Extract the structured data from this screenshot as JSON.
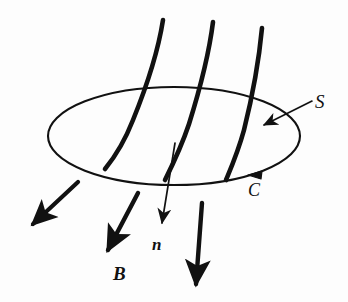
{
  "figure": {
    "background_color": "#fdfdfd",
    "ink_color": "#111111",
    "width": 348,
    "height": 302
  },
  "labels": {
    "surface": {
      "text": "S",
      "meaning": "open surface",
      "style": "italic-serif"
    },
    "boundary": {
      "text": "C",
      "meaning": "boundary curve of surface S",
      "style": "italic-serif"
    },
    "normal": {
      "text": "n",
      "meaning": "unit normal vector to surface",
      "style": "bold-italic-serif"
    },
    "field": {
      "text": "B",
      "meaning": "magnetic field vector",
      "style": "bold-italic-serif"
    }
  },
  "geometry": {
    "ellipse": {
      "center_x": 174,
      "center_y": 136,
      "radius_x": 126,
      "radius_y": 49,
      "stroke_width": 2.1
    },
    "field_lines": [
      {
        "name": "field-line-left",
        "path": "M163,20 C158,52 146,88 133,120 C124,143 114,158 105,169",
        "stroke_width": 4.6
      },
      {
        "name": "field-line-middle",
        "path": "M213,22 C209,54 199,92 189,124 C181,148 172,166 165,180",
        "stroke_width": 4.6
      },
      {
        "name": "field-line-right",
        "path": "M262,28 C259,60 252,98 244,130 C238,152 231,168 226,180",
        "stroke_width": 4.6
      }
    ],
    "field_arrows": [
      {
        "name": "field-arrow-outer-left",
        "path": "M78,182 L30,227",
        "stroke_width": 4.2,
        "head_size": 11
      },
      {
        "name": "field-arrow-B",
        "path": "M138,193 L106,254",
        "stroke_width": 4.4,
        "head_size": 12
      },
      {
        "name": "field-arrow-right",
        "path": "M202,203 L195,289",
        "stroke_width": 4.4,
        "head_size": 12
      }
    ],
    "normal_arrow": {
      "name": "normal-vector-arrow",
      "path": "M175,143 L161,228",
      "stroke_width": 1.7,
      "head_size": 7
    },
    "surface_pointer": {
      "name": "surface-leader-arrow",
      "path": "M312,101 L260,127",
      "stroke_width": 1.6,
      "head_size": 7
    },
    "boundary_direction_marker": {
      "name": "boundary-direction-arrowhead",
      "x": 254,
      "y": 172,
      "rotation_deg": 196,
      "size": 9
    }
  }
}
